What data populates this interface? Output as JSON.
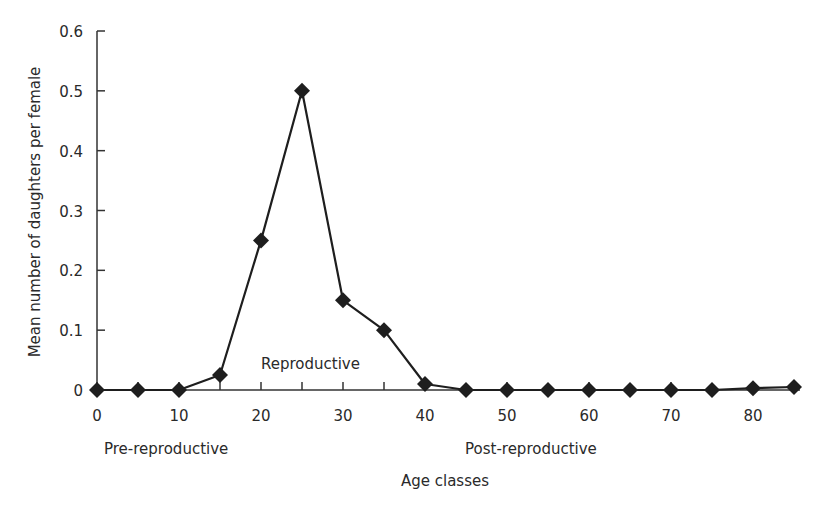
{
  "chart_data": {
    "type": "line",
    "title": "",
    "xlabel": "Age classes",
    "ylabel": "Mean number of daughters per female",
    "xlim": [
      0,
      85
    ],
    "ylim": [
      0,
      0.6
    ],
    "xticks": [
      0,
      10,
      20,
      30,
      40,
      50,
      60,
      70,
      80
    ],
    "xticks_minor": [
      5,
      15,
      25,
      35
    ],
    "yticks": [
      0,
      0.1,
      0.2,
      0.3,
      0.4,
      0.5,
      0.6
    ],
    "ytick_labels": [
      "0",
      "0.1",
      "0.2",
      "0.3",
      "0.4",
      "0.5",
      "0.6"
    ],
    "grid": false,
    "legend": "none",
    "series": [
      {
        "name": "Mean number of daughters per female",
        "marker": "diamond",
        "color": "#1e1e1e",
        "x": [
          0,
          5,
          10,
          15,
          20,
          25,
          30,
          35,
          40,
          45,
          50,
          55,
          60,
          65,
          70,
          75,
          80,
          85
        ],
        "values": [
          0,
          0,
          0,
          0.025,
          0.25,
          0.5,
          0.15,
          0.1,
          0.01,
          0,
          0,
          0,
          0,
          0,
          0,
          0,
          0.003,
          0.005
        ]
      }
    ],
    "annotations": [
      {
        "text": "Pre-reproductive",
        "position": "below-axis-left"
      },
      {
        "text": "Reproductive",
        "position": "above-axis-center-left"
      },
      {
        "text": "Post-reproductive",
        "position": "below-axis-right"
      }
    ]
  }
}
